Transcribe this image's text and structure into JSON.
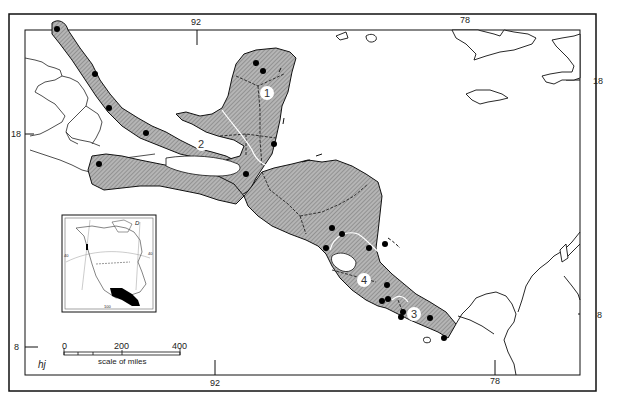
{
  "map": {
    "title": "",
    "graticule_labels": {
      "top_left_lon": "92",
      "top_right_lon": "78",
      "bottom_left_lon": "92",
      "bottom_right_lon": "78",
      "left_upper_lat": "18",
      "left_lower_lat": "8",
      "right_upper_lat": "18",
      "right_lower_lat": "8"
    },
    "region_labels": [
      "1",
      "2",
      "3",
      "4"
    ],
    "scale_bar": {
      "ticks": [
        "0",
        "200",
        "400"
      ],
      "caption": "scale of miles"
    },
    "inset": {
      "corner_letter": "D",
      "lat_labels": [
        "40",
        "40"
      ],
      "bottom_label": "100"
    },
    "signature": "hj",
    "colors": {
      "land_fill": "#a8a8a8",
      "outline": "#111111",
      "marker": "#000000",
      "background": "#ffffff"
    }
  }
}
